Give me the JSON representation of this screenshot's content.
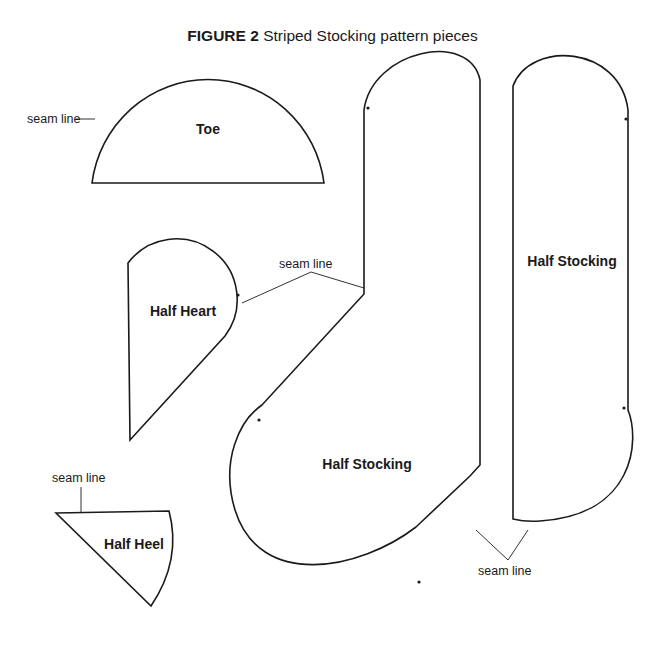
{
  "figure": {
    "label": "FIGURE 2",
    "caption": "Striped Stocking pattern pieces"
  },
  "pieces": {
    "toe": {
      "label": "Toe"
    },
    "half_heart": {
      "label": "Half Heart"
    },
    "half_heel": {
      "label": "Half Heel"
    },
    "half_stocking_front": {
      "label": "Half Stocking"
    },
    "half_stocking_back": {
      "label": "Half Stocking"
    }
  },
  "annotations": {
    "seam_toe": "seam line",
    "seam_heart": "seam line",
    "seam_heel": "seam line",
    "seam_stocking": "seam line"
  },
  "colors": {
    "line": "#1a1a1a",
    "background": "#ffffff"
  }
}
